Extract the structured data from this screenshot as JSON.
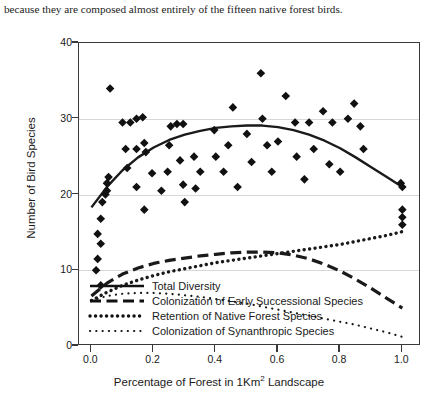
{
  "caption": "because they are composed almost entirely of the fifteen native forest birds.",
  "axis": {
    "y_title": "Number of Bird Species",
    "x_title_before": "Percentage of Forest in 1Km",
    "x_title_sup": "2",
    "x_title_after": " Landscape"
  },
  "chart_data": {
    "type": "scatter",
    "title": "",
    "xlabel": "Percentage of Forest in 1Km2 Landscape",
    "ylabel": "Number of Bird Species",
    "xlim": [
      -0.04,
      1.06
    ],
    "ylim": [
      0,
      40
    ],
    "xticks": [
      0.0,
      0.2,
      0.4,
      0.6,
      0.8,
      1.0
    ],
    "xtick_labels": [
      "0.0",
      "0.2",
      "0.4",
      "0.6",
      "0.8",
      "1.0"
    ],
    "yticks": [
      0,
      10,
      20,
      30,
      40
    ],
    "ytick_labels": [
      "0",
      "10",
      "20",
      "30",
      "40"
    ],
    "grid": "horizontal",
    "legend_position": "bottom-left-inside",
    "marker": "diamond",
    "points": [
      {
        "x": 0.015,
        "y": 10.0
      },
      {
        "x": 0.02,
        "y": 11.5
      },
      {
        "x": 0.03,
        "y": 13.5
      },
      {
        "x": 0.02,
        "y": 14.8
      },
      {
        "x": 0.03,
        "y": 16.8
      },
      {
        "x": 0.035,
        "y": 19.0
      },
      {
        "x": 0.045,
        "y": 20.0
      },
      {
        "x": 0.05,
        "y": 20.5
      },
      {
        "x": 0.05,
        "y": 21.5
      },
      {
        "x": 0.055,
        "y": 22.3
      },
      {
        "x": 0.03,
        "y": 8.0
      },
      {
        "x": 0.06,
        "y": 34.0
      },
      {
        "x": 0.1,
        "y": 29.5
      },
      {
        "x": 0.125,
        "y": 29.5
      },
      {
        "x": 0.145,
        "y": 30.0
      },
      {
        "x": 0.165,
        "y": 30.2
      },
      {
        "x": 0.11,
        "y": 26.0
      },
      {
        "x": 0.145,
        "y": 26.0
      },
      {
        "x": 0.17,
        "y": 26.8
      },
      {
        "x": 0.175,
        "y": 25.6
      },
      {
        "x": 0.115,
        "y": 23.5
      },
      {
        "x": 0.145,
        "y": 21.0
      },
      {
        "x": 0.17,
        "y": 18.0
      },
      {
        "x": 0.195,
        "y": 22.8
      },
      {
        "x": 0.225,
        "y": 20.5
      },
      {
        "x": 0.255,
        "y": 29.0
      },
      {
        "x": 0.275,
        "y": 29.3
      },
      {
        "x": 0.295,
        "y": 29.3
      },
      {
        "x": 0.25,
        "y": 26.5
      },
      {
        "x": 0.285,
        "y": 24.5
      },
      {
        "x": 0.295,
        "y": 21.3
      },
      {
        "x": 0.245,
        "y": 23.0
      },
      {
        "x": 0.33,
        "y": 25.0
      },
      {
        "x": 0.35,
        "y": 23.0
      },
      {
        "x": 0.335,
        "y": 20.8
      },
      {
        "x": 0.3,
        "y": 19.0
      },
      {
        "x": 0.395,
        "y": 28.5
      },
      {
        "x": 0.4,
        "y": 25.0
      },
      {
        "x": 0.425,
        "y": 23.0
      },
      {
        "x": 0.44,
        "y": 26.5
      },
      {
        "x": 0.455,
        "y": 31.5
      },
      {
        "x": 0.47,
        "y": 21.0
      },
      {
        "x": 0.5,
        "y": 28.0
      },
      {
        "x": 0.515,
        "y": 24.3
      },
      {
        "x": 0.545,
        "y": 36.0
      },
      {
        "x": 0.55,
        "y": 30.0
      },
      {
        "x": 0.565,
        "y": 26.5
      },
      {
        "x": 0.58,
        "y": 23.0
      },
      {
        "x": 0.6,
        "y": 27.0
      },
      {
        "x": 0.625,
        "y": 33.0
      },
      {
        "x": 0.655,
        "y": 29.5
      },
      {
        "x": 0.66,
        "y": 25.0
      },
      {
        "x": 0.685,
        "y": 22.0
      },
      {
        "x": 0.7,
        "y": 29.5
      },
      {
        "x": 0.715,
        "y": 26.0
      },
      {
        "x": 0.745,
        "y": 31.0
      },
      {
        "x": 0.765,
        "y": 24.0
      },
      {
        "x": 0.775,
        "y": 29.5
      },
      {
        "x": 0.8,
        "y": 23.0
      },
      {
        "x": 0.825,
        "y": 30.0
      },
      {
        "x": 0.845,
        "y": 32.0
      },
      {
        "x": 0.865,
        "y": 29.0
      },
      {
        "x": 0.875,
        "y": 26.0
      },
      {
        "x": 0.995,
        "y": 21.5
      },
      {
        "x": 1.0,
        "y": 21.0
      },
      {
        "x": 1.0,
        "y": 18.0
      },
      {
        "x": 1.0,
        "y": 17.0
      },
      {
        "x": 1.0,
        "y": 16.0
      }
    ],
    "series": [
      {
        "name": "Total Diversity",
        "style": "solid",
        "curve": [
          {
            "x": 0.0,
            "y": 18.3
          },
          {
            "x": 0.05,
            "y": 21.0
          },
          {
            "x": 0.1,
            "y": 23.2
          },
          {
            "x": 0.15,
            "y": 24.9
          },
          {
            "x": 0.2,
            "y": 26.2
          },
          {
            "x": 0.25,
            "y": 27.2
          },
          {
            "x": 0.3,
            "y": 27.9
          },
          {
            "x": 0.35,
            "y": 28.4
          },
          {
            "x": 0.4,
            "y": 28.8
          },
          {
            "x": 0.45,
            "y": 29.0
          },
          {
            "x": 0.5,
            "y": 29.1
          },
          {
            "x": 0.55,
            "y": 29.1
          },
          {
            "x": 0.6,
            "y": 28.9
          },
          {
            "x": 0.65,
            "y": 28.5
          },
          {
            "x": 0.7,
            "y": 27.9
          },
          {
            "x": 0.75,
            "y": 27.1
          },
          {
            "x": 0.8,
            "y": 26.1
          },
          {
            "x": 0.85,
            "y": 24.9
          },
          {
            "x": 0.9,
            "y": 23.6
          },
          {
            "x": 0.95,
            "y": 22.3
          },
          {
            "x": 1.0,
            "y": 21.0
          }
        ]
      },
      {
        "name": "Colonization of Early Successional Species",
        "style": "dashed",
        "curve": [
          {
            "x": 0.0,
            "y": 6.6
          },
          {
            "x": 0.05,
            "y": 8.3
          },
          {
            "x": 0.1,
            "y": 9.5
          },
          {
            "x": 0.15,
            "y": 10.3
          },
          {
            "x": 0.2,
            "y": 10.9
          },
          {
            "x": 0.25,
            "y": 11.3
          },
          {
            "x": 0.3,
            "y": 11.6
          },
          {
            "x": 0.35,
            "y": 11.9
          },
          {
            "x": 0.4,
            "y": 12.1
          },
          {
            "x": 0.45,
            "y": 12.3
          },
          {
            "x": 0.5,
            "y": 12.4
          },
          {
            "x": 0.55,
            "y": 12.4
          },
          {
            "x": 0.6,
            "y": 12.3
          },
          {
            "x": 0.65,
            "y": 12.0
          },
          {
            "x": 0.7,
            "y": 11.5
          },
          {
            "x": 0.75,
            "y": 10.8
          },
          {
            "x": 0.8,
            "y": 9.9
          },
          {
            "x": 0.85,
            "y": 8.8
          },
          {
            "x": 0.9,
            "y": 7.6
          },
          {
            "x": 0.95,
            "y": 6.3
          },
          {
            "x": 1.0,
            "y": 5.0
          }
        ]
      },
      {
        "name": "Retention of Native Forest Species",
        "style": "dotted-thick",
        "curve": [
          {
            "x": 0.0,
            "y": 6.0
          },
          {
            "x": 0.05,
            "y": 7.1
          },
          {
            "x": 0.1,
            "y": 8.0
          },
          {
            "x": 0.15,
            "y": 8.7
          },
          {
            "x": 0.2,
            "y": 9.3
          },
          {
            "x": 0.25,
            "y": 9.8
          },
          {
            "x": 0.3,
            "y": 10.2
          },
          {
            "x": 0.35,
            "y": 10.6
          },
          {
            "x": 0.4,
            "y": 11.0
          },
          {
            "x": 0.45,
            "y": 11.3
          },
          {
            "x": 0.5,
            "y": 11.6
          },
          {
            "x": 0.55,
            "y": 11.9
          },
          {
            "x": 0.6,
            "y": 12.2
          },
          {
            "x": 0.65,
            "y": 12.5
          },
          {
            "x": 0.7,
            "y": 12.8
          },
          {
            "x": 0.75,
            "y": 13.1
          },
          {
            "x": 0.8,
            "y": 13.4
          },
          {
            "x": 0.85,
            "y": 13.8
          },
          {
            "x": 0.9,
            "y": 14.2
          },
          {
            "x": 0.95,
            "y": 14.6
          },
          {
            "x": 1.0,
            "y": 15.1
          }
        ]
      },
      {
        "name": "Colonization of Synanthropic Species",
        "style": "dotted-fine",
        "curve": [
          {
            "x": 0.0,
            "y": 6.0
          },
          {
            "x": 0.05,
            "y": 6.6
          },
          {
            "x": 0.1,
            "y": 6.9
          },
          {
            "x": 0.15,
            "y": 7.0
          },
          {
            "x": 0.2,
            "y": 7.0
          },
          {
            "x": 0.25,
            "y": 6.9
          },
          {
            "x": 0.3,
            "y": 6.7
          },
          {
            "x": 0.35,
            "y": 6.5
          },
          {
            "x": 0.4,
            "y": 6.2
          },
          {
            "x": 0.45,
            "y": 5.9
          },
          {
            "x": 0.5,
            "y": 5.6
          },
          {
            "x": 0.55,
            "y": 5.2
          },
          {
            "x": 0.6,
            "y": 4.8
          },
          {
            "x": 0.65,
            "y": 4.4
          },
          {
            "x": 0.7,
            "y": 4.0
          },
          {
            "x": 0.75,
            "y": 3.6
          },
          {
            "x": 0.8,
            "y": 3.2
          },
          {
            "x": 0.85,
            "y": 2.8
          },
          {
            "x": 0.9,
            "y": 2.3
          },
          {
            "x": 0.95,
            "y": 1.8
          },
          {
            "x": 1.0,
            "y": 1.2
          }
        ]
      }
    ]
  }
}
